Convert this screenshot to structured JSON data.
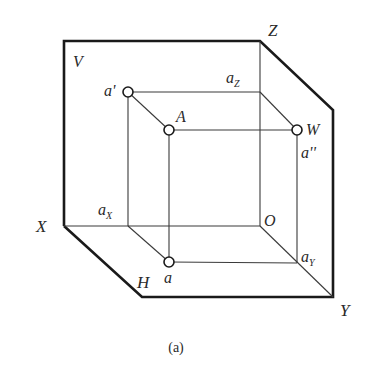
{
  "figure": {
    "caption": "(a)",
    "planes": {
      "V": "V",
      "H": "H",
      "W": "W"
    },
    "axes": {
      "X": "X",
      "Y": "Y",
      "Z": "Z",
      "O": "O"
    },
    "points": {
      "A": "A",
      "a_prime": "a'",
      "a": "a",
      "a_double_prime": "a''",
      "a_X_base": "a",
      "a_X_sub": "X",
      "a_Y_base": "a",
      "a_Y_sub": "Y",
      "a_Z_base": "a",
      "a_Z_sub": "Z"
    },
    "colors": {
      "line": "#1a1a1a",
      "background": "#ffffff"
    }
  }
}
